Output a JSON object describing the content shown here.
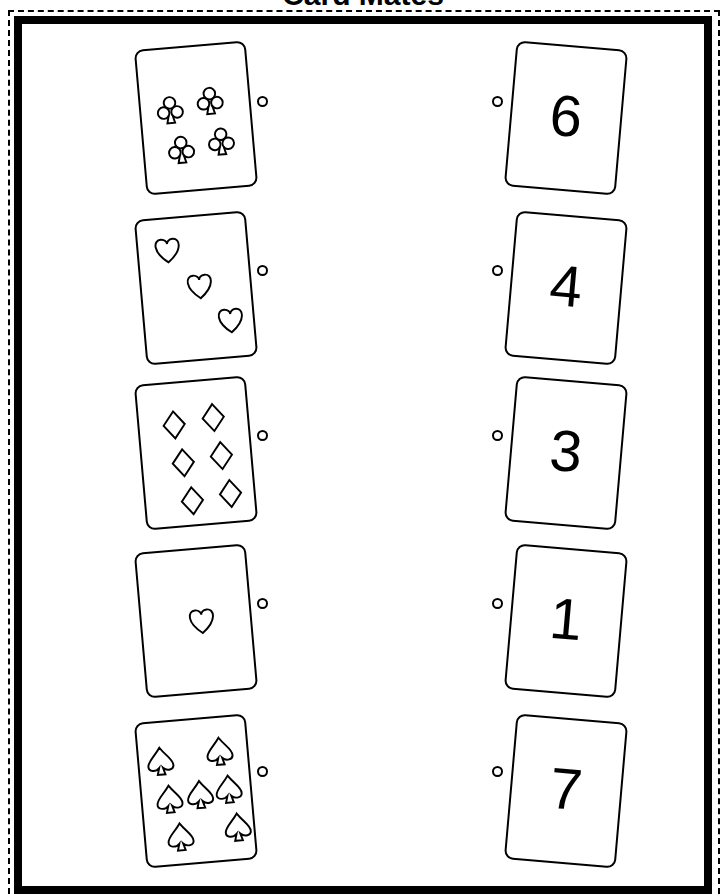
{
  "worksheet": {
    "title": "Card Mates",
    "left_column": [
      {
        "suit": "clubs",
        "count": 4,
        "icon": "club-icon"
      },
      {
        "suit": "hearts",
        "count": 3,
        "icon": "heart-icon"
      },
      {
        "suit": "diamonds",
        "count": 6,
        "icon": "diamond-icon"
      },
      {
        "suit": "hearts",
        "count": 1,
        "icon": "heart-icon"
      },
      {
        "suit": "spades",
        "count": 7,
        "icon": "spade-icon"
      }
    ],
    "right_column": [
      {
        "number": "6"
      },
      {
        "number": "4"
      },
      {
        "number": "3"
      },
      {
        "number": "1"
      },
      {
        "number": "7"
      }
    ]
  }
}
